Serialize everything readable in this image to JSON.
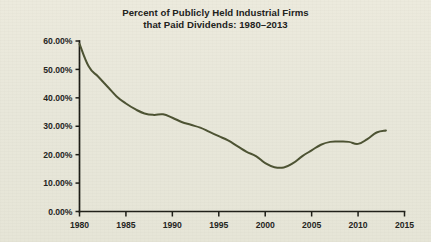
{
  "figure": {
    "background_color": "#e9e8db",
    "title_lines": [
      "Percent of Publicly Held Industrial Firms",
      "that Paid Dividends: 1980–2013"
    ],
    "title_color": "#20201a"
  },
  "chart_data": {
    "type": "line",
    "title": "Percent of Publicly Held Industrial Firms that Paid Dividends: 1980–2013",
    "subtitle": "",
    "xlabel": "",
    "ylabel": "",
    "xlim": [
      1980,
      2015
    ],
    "ylim": [
      0,
      60
    ],
    "grid": false,
    "legend": false,
    "legend_position": "none",
    "line_color": "#4c5232",
    "x_tick_labels": [
      "1980",
      "1985",
      "1990",
      "1995",
      "2000",
      "2005",
      "2010",
      "2015"
    ],
    "x_ticks": [
      1980,
      1985,
      1990,
      1995,
      2000,
      2005,
      2010,
      2015
    ],
    "y_tick_labels": [
      "0.00%",
      "10.00%",
      "20.00%",
      "30.00%",
      "40.00%",
      "50.00%",
      "60.00%"
    ],
    "y_ticks": [
      0,
      10,
      20,
      30,
      40,
      50,
      60
    ],
    "x": [
      1980,
      1981,
      1982,
      1983,
      1984,
      1985,
      1986,
      1987,
      1988,
      1989,
      1990,
      1991,
      1992,
      1993,
      1994,
      1995,
      1996,
      1997,
      1998,
      1999,
      2000,
      2001,
      2002,
      2003,
      2004,
      2005,
      2006,
      2007,
      2008,
      2009,
      2010,
      2011,
      2012,
      2013
    ],
    "values": [
      59.0,
      51.0,
      47.5,
      44.0,
      40.5,
      38.0,
      36.0,
      34.5,
      34.0,
      34.2,
      33.0,
      31.5,
      30.5,
      29.5,
      28.0,
      26.5,
      25.0,
      23.0,
      21.0,
      19.5,
      17.0,
      15.6,
      15.5,
      17.0,
      19.5,
      21.5,
      23.5,
      24.5,
      24.6,
      24.5,
      23.8,
      25.5,
      27.8,
      28.5
    ],
    "series": [
      {
        "name": "Percent of publicly held industrial firms that paid dividends",
        "color": "#4c5232",
        "values": [
          59.0,
          51.0,
          47.5,
          44.0,
          40.5,
          38.0,
          36.0,
          34.5,
          34.0,
          34.2,
          33.0,
          31.5,
          30.5,
          29.5,
          28.0,
          26.5,
          25.0,
          23.0,
          21.0,
          19.5,
          17.0,
          15.6,
          15.5,
          17.0,
          19.5,
          21.5,
          23.5,
          24.5,
          24.6,
          24.5,
          23.8,
          25.5,
          27.8,
          28.5
        ]
      }
    ]
  }
}
